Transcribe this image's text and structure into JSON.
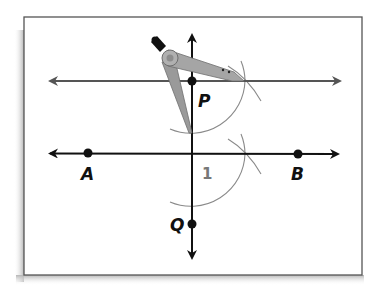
{
  "figure": {
    "colors": {
      "background": "#ffffff",
      "frame": "#555555",
      "shadow": "#bdbdbd",
      "upper_line": "#555555",
      "lower_line": "#111111",
      "transversal": "#111111",
      "arc": "#8a8a8a",
      "compass": "#9a9a9a",
      "compass_dark": "#6e6e6e",
      "compass_handle": "#111111",
      "angle_label": "#777777"
    },
    "points": [
      {
        "name": "P",
        "label": "P",
        "x": 192,
        "y": 81
      },
      {
        "name": "Q",
        "label": "Q",
        "x": 192,
        "y": 224
      },
      {
        "name": "A",
        "label": "A",
        "x": 88,
        "y": 153
      },
      {
        "name": "B",
        "label": "B",
        "x": 298,
        "y": 154
      }
    ],
    "angle_label": "1",
    "lines": [
      {
        "name": "parallel-line-through-P",
        "x1": 50,
        "y1": 81,
        "x2": 340,
        "y2": 81
      },
      {
        "name": "line-AB",
        "x1": 50,
        "y1": 153,
        "x2": 338,
        "y2": 154
      },
      {
        "name": "transversal-PQ",
        "x1": 192,
        "y1": 35,
        "x2": 192,
        "y2": 258
      }
    ],
    "tool": "compass"
  }
}
